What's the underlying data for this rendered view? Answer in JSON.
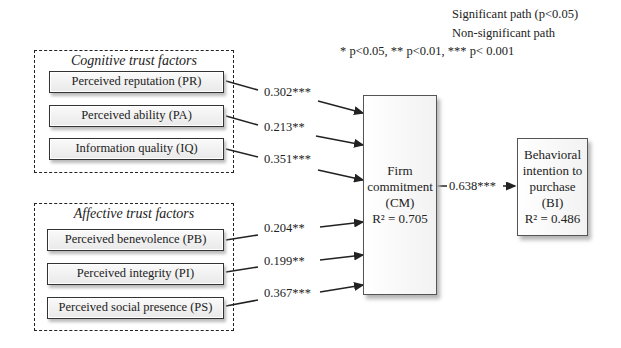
{
  "legend": {
    "significant": "Significant path (p<0.05)",
    "nonsignificant": "Non-significant path",
    "pvalues": "* p<0.05, ** p<0.01, *** p< 0.001"
  },
  "groups": {
    "cognitive": {
      "title": "Cognitive trust factors",
      "factors": [
        {
          "label": "Perceived reputation (PR)",
          "coef": "0.302***"
        },
        {
          "label": "Perceived ability (PA)",
          "coef": "0.213**"
        },
        {
          "label": "Information quality (IQ)",
          "coef": "0.351***"
        }
      ]
    },
    "affective": {
      "title": "Affective trust factors",
      "factors": [
        {
          "label": "Perceived benevolence (PB)",
          "coef": "0.204**"
        },
        {
          "label": "Perceived integrity (PI)",
          "coef": "0.199**"
        },
        {
          "label": "Perceived social presence (PS)",
          "coef": "0.367***"
        }
      ]
    }
  },
  "constructs": {
    "cm": {
      "line1": "Firm",
      "line2": "commitment",
      "line3": "(CM)",
      "r2": "R² = 0.705"
    },
    "bi": {
      "line1": "Behavioral",
      "line2": "intention to",
      "line3": "purchase",
      "line4": "(BI)",
      "r2": "R² = 0.486"
    }
  },
  "cm_to_bi_coef": "0.638***"
}
